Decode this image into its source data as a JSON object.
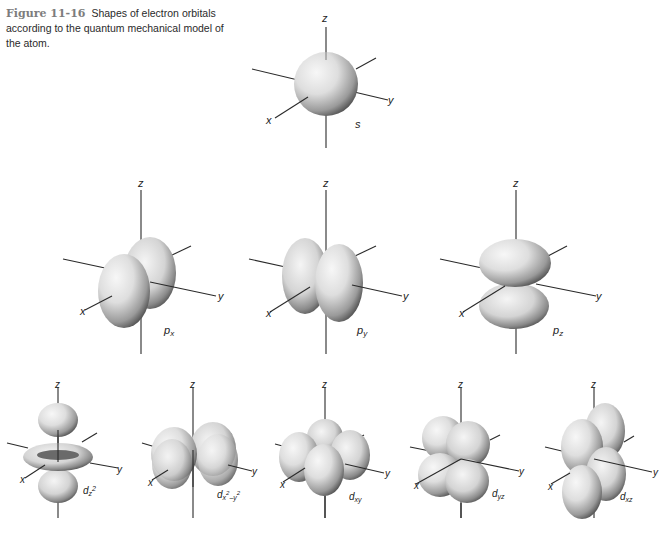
{
  "caption": {
    "figure_number": "Figure 11-16",
    "text": "Shapes of electron orbitals according to the quantum mechanical model of the atom."
  },
  "axes_labels": {
    "x": "x",
    "y": "y",
    "z": "z"
  },
  "orbitals": [
    {
      "id": "s",
      "label": "s",
      "sub": "",
      "row": 1
    },
    {
      "id": "px",
      "label": "p",
      "sub": "x",
      "row": 2
    },
    {
      "id": "py",
      "label": "p",
      "sub": "y",
      "row": 2
    },
    {
      "id": "pz",
      "label": "p",
      "sub": "z",
      "row": 2
    },
    {
      "id": "dz2",
      "label": "d",
      "sub": "z",
      "sup": "2",
      "row": 3
    },
    {
      "id": "dx2-y2",
      "label": "d",
      "sub": "x",
      "sup": "2",
      "sub2": "–y",
      "sup2": "2",
      "row": 3
    },
    {
      "id": "dxy",
      "label": "d",
      "sub": "xy",
      "row": 3
    },
    {
      "id": "dyz",
      "label": "d",
      "sub": "yz",
      "row": 3
    },
    {
      "id": "dxz",
      "label": "d",
      "sub": "xz",
      "row": 3
    }
  ],
  "colors": {
    "lobe_light": "#f2f2f2",
    "lobe_mid": "#c9c9c9",
    "lobe_dark": "#4a4a4a",
    "axis": "#2a2a2a",
    "caption_figure_number": "#7d7d7d"
  }
}
